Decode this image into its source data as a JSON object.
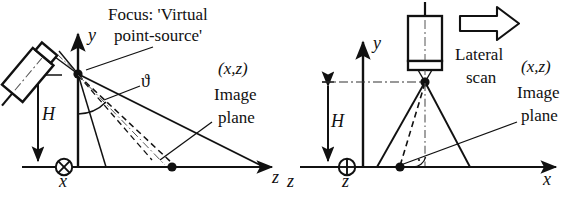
{
  "figure": {
    "type": "technical-diagram"
  },
  "left_panel": {
    "name": "angled-incidence-panel",
    "callout_line1": "Focus: 'Virtual",
    "callout_line2": "point-source'",
    "angle_symbol": "ϑ",
    "height_label": "H",
    "coord_label": "(x,z)",
    "image_plane_line1": "Image",
    "image_plane_line2": "plane",
    "axis_y": "y",
    "axis_z": "z",
    "axis_x": "x",
    "x_axis_symbol": "into-page-circle-x",
    "transducer": "tilted-transducer"
  },
  "right_panel": {
    "name": "normal-incidence-panel",
    "scan_line1": "Lateral",
    "scan_line2": "scan",
    "scan_arrow": "right-arrow-outline",
    "height_label": "H",
    "coord_label": "(x,z)",
    "image_plane_line1": "Image",
    "image_plane_line2": "plane",
    "axis_y": "y",
    "axis_x": "x",
    "axis_z": "z",
    "axis_z_left": "z",
    "z_axis_symbol": "out-of-page-circle-plus",
    "transducer": "vertical-transducer",
    "right_angle_marker": "perpendicular-symbol"
  },
  "colors": {
    "ink": "#111111",
    "background": "#ffffff",
    "gray": "#555555"
  }
}
